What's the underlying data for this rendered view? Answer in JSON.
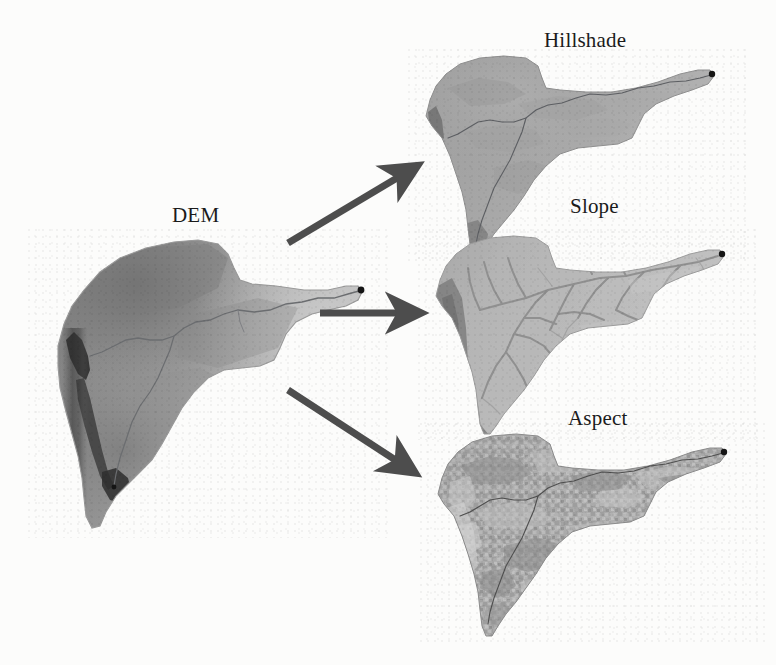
{
  "figure": {
    "type": "gis-diagram",
    "background_color": "#fcfcfb"
  },
  "labels": {
    "dem": "DEM",
    "hillshade": "Hillshade",
    "slope": "Slope",
    "aspect": "Aspect"
  },
  "panels": [
    {
      "id": "dem",
      "label": "DEM",
      "role": "source",
      "render": "continuous elevation grayscale, dark high ridge along western edge fading to light lowlands eastward",
      "bounds": {
        "x": 40,
        "y": 238,
        "w": 330,
        "h": 290
      },
      "has_stream_network": true,
      "has_outlet_point": true
    },
    {
      "id": "hillshade",
      "label": "Hillshade",
      "role": "derivative",
      "render": "uniform mid-gray shaded relief with soft illumination from northwest",
      "bounds": {
        "x": 416,
        "y": 56,
        "w": 312,
        "h": 192
      },
      "has_stream_network": true,
      "has_outlet_point": true
    },
    {
      "id": "slope",
      "label": "Slope",
      "role": "derivative",
      "render": "light gray base with dark dendritic steep-gradient lines and dark western escarpment",
      "bounds": {
        "x": 426,
        "y": 236,
        "w": 316,
        "h": 192
      },
      "has_stream_network": true,
      "has_outlet_point": true
    },
    {
      "id": "aspect",
      "label": "Aspect",
      "role": "derivative",
      "render": "high-frequency mottled gray texture of slope-facing direction classes",
      "bounds": {
        "x": 428,
        "y": 430,
        "w": 318,
        "h": 200
      },
      "has_stream_network": true,
      "has_outlet_point": true
    }
  ],
  "arrows": [
    {
      "id": "arrow-to-hillshade",
      "from": "dem",
      "to": "hillshade",
      "direction": "up-right",
      "x1": 288,
      "y1": 243,
      "x2": 407,
      "y2": 172
    },
    {
      "id": "arrow-to-slope",
      "from": "dem",
      "to": "slope",
      "direction": "right",
      "x1": 320,
      "y1": 313,
      "x2": 408,
      "y2": 313
    },
    {
      "id": "arrow-to-aspect",
      "from": "dem",
      "to": "aspect",
      "direction": "down-right",
      "x1": 288,
      "y1": 390,
      "x2": 406,
      "y2": 467
    }
  ],
  "colors": {
    "arrow": "#4d4d4d",
    "label_text": "#1b1b1b",
    "outlet_point": "#151515",
    "stream_line": "#5d5f63",
    "background": "#fcfcfb"
  }
}
